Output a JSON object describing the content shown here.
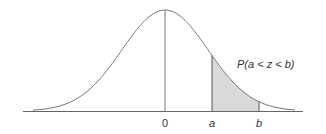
{
  "diagram": {
    "annotation": "P(a < z < b)",
    "ticks": [
      {
        "label": "0",
        "x": 165
      },
      {
        "label": "a",
        "x": 212
      },
      {
        "label": "b",
        "x": 259
      }
    ],
    "colors": {
      "curve": "#777777",
      "axis": "#666666",
      "shade": "#d9d9d9",
      "text": "#333333"
    }
  }
}
